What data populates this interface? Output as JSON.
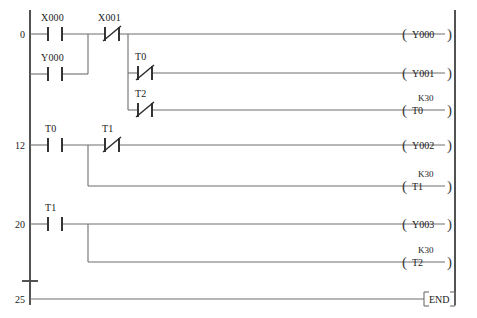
{
  "diagram": {
    "type": "plc-ladder-diagram",
    "width": 477,
    "height": 318,
    "colors": {
      "background": "#ffffff",
      "wire": "#6e6e6e",
      "rail": "#4a4a4a",
      "symbol": "#2b2b2b",
      "text": "#1a1a1a"
    },
    "end_instruction": "END"
  },
  "steps": [
    {
      "number": "0"
    },
    {
      "number": "12"
    },
    {
      "number": "20"
    },
    {
      "number": "25"
    }
  ],
  "contacts": [
    {
      "id": "c1",
      "label": "X000",
      "type": "NO",
      "x": 48,
      "y": 34
    },
    {
      "id": "c2",
      "label": "X001",
      "type": "NC",
      "x": 105,
      "y": 34
    },
    {
      "id": "c3",
      "label": "Y000",
      "type": "NO",
      "x": 48,
      "y": 74
    },
    {
      "id": "c4",
      "label": "T0",
      "type": "NC",
      "x": 138,
      "y": 73
    },
    {
      "id": "c5",
      "label": "T2",
      "type": "NC",
      "x": 138,
      "y": 110
    },
    {
      "id": "c6",
      "label": "T0",
      "type": "NO",
      "x": 48,
      "y": 145
    },
    {
      "id": "c7",
      "label": "T1",
      "type": "NC",
      "x": 105,
      "y": 145
    },
    {
      "id": "c8",
      "label": "T1",
      "type": "NO",
      "x": 48,
      "y": 224
    }
  ],
  "coils": [
    {
      "id": "o1",
      "label": "Y000",
      "preset": "",
      "y": 34,
      "kind": "coil"
    },
    {
      "id": "o2",
      "label": "Y001",
      "preset": "",
      "y": 73,
      "kind": "coil"
    },
    {
      "id": "o3",
      "label": "T0",
      "preset": "K30",
      "y": 110,
      "kind": "timer"
    },
    {
      "id": "o4",
      "label": "Y002",
      "preset": "",
      "y": 145,
      "kind": "coil"
    },
    {
      "id": "o5",
      "label": "T1",
      "preset": "K30",
      "y": 186,
      "kind": "timer"
    },
    {
      "id": "o6",
      "label": "Y003",
      "preset": "",
      "y": 224,
      "kind": "coil"
    },
    {
      "id": "o7",
      "label": "T2",
      "preset": "K30",
      "y": 262,
      "kind": "timer"
    },
    {
      "id": "o8",
      "label": "END",
      "preset": "",
      "y": 299,
      "kind": "end"
    }
  ],
  "rungs": [
    {
      "step": "0",
      "inputs": [
        "X000",
        "X001",
        "Y000",
        "T0",
        "T2"
      ],
      "outputs": [
        "Y000",
        "Y001",
        "T0"
      ]
    },
    {
      "step": "12",
      "inputs": [
        "T0",
        "T1"
      ],
      "outputs": [
        "Y002",
        "T1"
      ]
    },
    {
      "step": "20",
      "inputs": [
        "T1"
      ],
      "outputs": [
        "Y003",
        "T2"
      ]
    },
    {
      "step": "25",
      "inputs": [],
      "outputs": [
        "END"
      ]
    }
  ]
}
